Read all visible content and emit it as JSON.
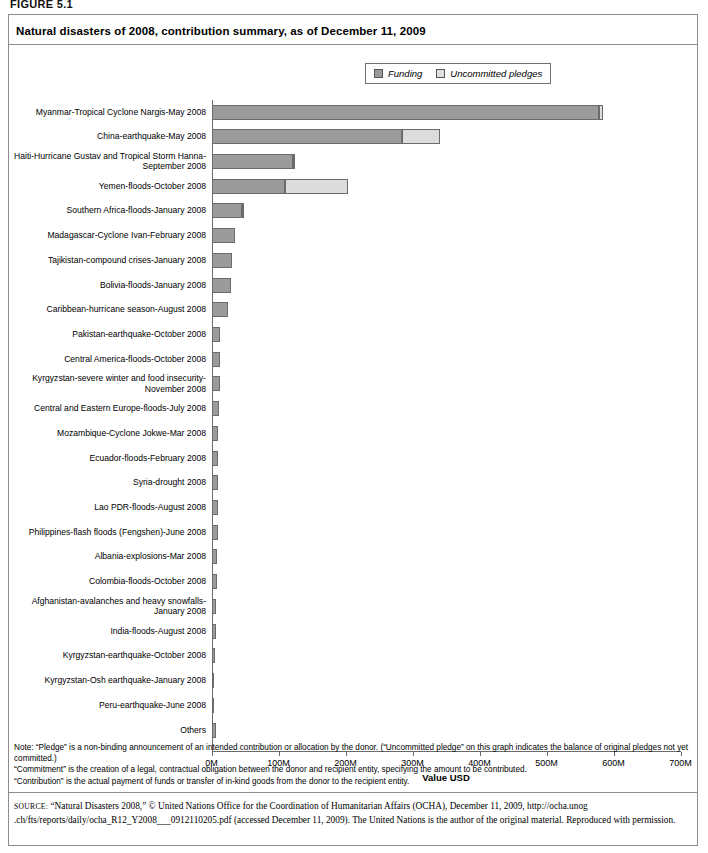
{
  "figure_label": "FIGURE 5.1",
  "chart_title": "Natural disasters of 2008, contribution summary, as of December 11, 2009",
  "legend": {
    "items": [
      {
        "label": "Funding",
        "color": "#9b9b9b",
        "icon": "legend-swatch-icon"
      },
      {
        "label": "Uncommitted pledges",
        "color": "#dcdcdc",
        "icon": "legend-swatch-icon"
      }
    ]
  },
  "notes": [
    "Note: “Pledge” is a non-binding announcement of an intended contribution or allocation by the donor. (“Uncommitted pledge” on this graph indicates the balance of original pledges not yet committed.)",
    "“Commitment” is the  creation of a legal, contractual obligation between the donor and recipient entity, specifying the amount to be contributed.",
    "“Contribution” is the actual payment of funds or transfer of in-kind goods from the donor to the recipient entity."
  ],
  "source": {
    "prefix": "SOURCE:",
    "text": " “Natural Disasters 2008,” © United Nations Office for the Coordination of Humanitarian Affairs (OCHA), December 11, 2009, http://ocha.unog .ch/fts/reports/daily/ocha_R12_Y2008___0912110205.pdf (accessed December 11, 2009). The United Nations is the author of the original material. Reproduced with permission."
  },
  "chart_data": {
    "type": "bar",
    "orientation": "horizontal",
    "stacked": true,
    "title": "Natural disasters of 2008, contribution summary, as of December 11, 2009",
    "xlabel": "Value USD",
    "ylabel": "",
    "xlim": [
      0,
      700000000
    ],
    "xticks": [
      0,
      100000000,
      200000000,
      300000000,
      400000000,
      500000000,
      600000000,
      700000000
    ],
    "xticklabels": [
      "0M",
      "100M",
      "200M",
      "300M",
      "400M",
      "500M",
      "600M",
      "700M"
    ],
    "grid": false,
    "legend_position": "top-center",
    "units": "USD",
    "categories": [
      "Myanmar-Tropical Cyclone Nargis-May 2008",
      "China-earthquake-May 2008",
      "Haiti-Hurricane Gustav and Tropical Storm Hanna-September 2008",
      "Yemen-floods-October 2008",
      "Southern Africa-floods-January 2008",
      "Madagascar-Cyclone Ivan-February 2008",
      "Tajikistan-compound crises-January 2008",
      "Bolivia-floods-January 2008",
      "Caribbean-hurricane season-August 2008",
      "Pakistan-earthquake-October 2008",
      "Central America-floods-October 2008",
      "Kyrgyzstan-severe winter and food insecurity-November 2008",
      "Central and Eastern Europe-floods-July 2008",
      "Mozambique-Cyclone Jokwe-Mar 2008",
      "Ecuador-floods-February 2008",
      "Syria-drought 2008",
      "Lao PDR-floods-August 2008",
      "Philippines-flash floods (Fengshen)-June 2008",
      "Albania-explosions-Mar 2008",
      "Colombia-floods-October 2008",
      "Afghanistan-avalanches and heavy snowfalls-January 2008",
      "India-floods-August 2008",
      "Kyrgyzstan-earthquake-October 2008",
      "Kyrgyzstan-Osh earthquake-January 2008",
      "Peru-earthquake-June 2008",
      "Others"
    ],
    "series": [
      {
        "name": "Funding",
        "color": "#9b9b9b",
        "values": [
          578000000,
          285000000,
          121000000,
          109000000,
          46000000,
          35000000,
          31000000,
          29000000,
          25000000,
          13000000,
          13000000,
          12000000,
          11000000,
          10000000,
          10000000,
          9000000,
          9000000,
          9000000,
          8000000,
          8000000,
          7000000,
          6000000,
          5000000,
          4000000,
          3000000,
          7000000
        ]
      },
      {
        "name": "Uncommitted pledges",
        "color": "#dcdcdc",
        "values": [
          6000000,
          56000000,
          2000000,
          95000000,
          2000000,
          0,
          0,
          0,
          0,
          0,
          0,
          0,
          0,
          0,
          0,
          0,
          0,
          0,
          0,
          0,
          0,
          0,
          0,
          0,
          0,
          0
        ]
      }
    ]
  }
}
